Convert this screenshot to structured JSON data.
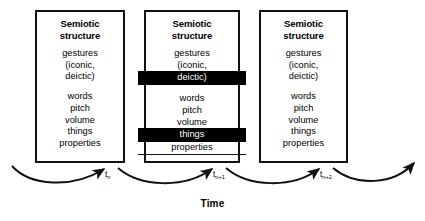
{
  "figure": {
    "time_axis_label": "Time",
    "boxes": [
      {
        "id": "box-tn",
        "title_line1": "Semiotic",
        "title_line2": "structure",
        "terms": [
          {
            "text": "gestures",
            "highlight": false,
            "gap_above": false
          },
          {
            "text": "(iconic,",
            "highlight": false,
            "gap_above": false
          },
          {
            "text": "deictic)",
            "highlight": false,
            "gap_above": false
          },
          {
            "text": "words",
            "highlight": false,
            "gap_above": true
          },
          {
            "text": "pitch",
            "highlight": false,
            "gap_above": false
          },
          {
            "text": "volume",
            "highlight": false,
            "gap_above": false
          },
          {
            "text": "things",
            "highlight": false,
            "gap_above": false
          },
          {
            "text": "properties",
            "highlight": false,
            "gap_above": false
          }
        ]
      },
      {
        "id": "box-tn1",
        "title_line1": "Semiotic",
        "title_line2": "structure",
        "terms": [
          {
            "text": "gestures",
            "highlight": false,
            "gap_above": false
          },
          {
            "text": "(iconic,",
            "highlight": false,
            "gap_above": false
          },
          {
            "text": "deictic)",
            "highlight": true,
            "gap_above": false
          },
          {
            "text": "words",
            "highlight": false,
            "gap_above": true
          },
          {
            "text": "pitch",
            "highlight": false,
            "gap_above": false
          },
          {
            "text": "volume",
            "highlight": false,
            "gap_above": false
          },
          {
            "text": "things",
            "highlight": true,
            "gap_above": false
          },
          {
            "text": "properties",
            "highlight": false,
            "gap_above": false,
            "rule_below": true
          }
        ]
      },
      {
        "id": "box-tn2",
        "title_line1": "Semiotic",
        "title_line2": "structure",
        "terms": [
          {
            "text": "gestures",
            "highlight": false,
            "gap_above": false
          },
          {
            "text": "(iconic,",
            "highlight": false,
            "gap_above": false
          },
          {
            "text": "deictic)",
            "highlight": false,
            "gap_above": false
          },
          {
            "text": "words",
            "highlight": false,
            "gap_above": true
          },
          {
            "text": "pitch",
            "highlight": false,
            "gap_above": false
          },
          {
            "text": "volume",
            "highlight": false,
            "gap_above": false
          },
          {
            "text": "things",
            "highlight": false,
            "gap_above": false
          },
          {
            "text": "properties",
            "highlight": false,
            "gap_above": false
          }
        ]
      }
    ],
    "time_ticks": [
      {
        "base": "t",
        "sub": "n"
      },
      {
        "base": "t",
        "sub": "n+1"
      },
      {
        "base": "t",
        "sub": "n+2"
      }
    ],
    "colors": {
      "stroke": "#111111",
      "highlight_bg": "#000000",
      "highlight_fg": "#ffffff",
      "background": "#ffffff"
    }
  }
}
